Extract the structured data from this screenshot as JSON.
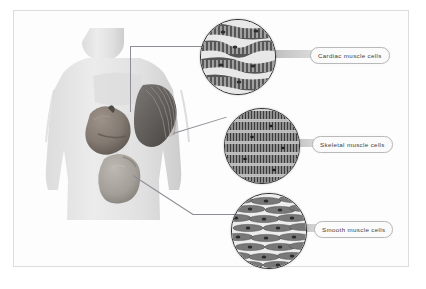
{
  "figure": {
    "background_color": "#ffffff",
    "border_color": "#dcdcdc"
  },
  "body_diagram": {
    "name": "human-torso",
    "description": "Grayscale male torso shown from the front with internal organs visible",
    "skin_color": "#e3e3e3",
    "organs": [
      {
        "name": "heart",
        "tissue": "cardiac",
        "color": "#8a8078"
      },
      {
        "name": "pectoral-muscle",
        "tissue": "skeletal",
        "color": "#6d6a68"
      },
      {
        "name": "stomach",
        "tissue": "smooth",
        "color": "#a9a49d"
      }
    ]
  },
  "callouts": [
    {
      "id": "cardiac",
      "label": "Cardiac muscle cells",
      "source_organ": "heart",
      "tissue_description": "Branching striated fibers joined at intercalated discs",
      "cell_color": "#5a5a5a",
      "background_color": "#e6e6e6"
    },
    {
      "id": "skeletal",
      "label": "Skeletal muscle cells",
      "source_organ": "pectoral-muscle",
      "tissue_description": "Long parallel multinucleated striated fibers",
      "cell_color": "#3f3f3f",
      "background_color": "#cfcfcf"
    },
    {
      "id": "smooth",
      "label": "Smooth muscle cells",
      "source_organ": "stomach",
      "tissue_description": "Spindle-shaped non-striated cells with single central nuclei",
      "cell_color": "#6b6b6b",
      "background_color": "#e2e2e2"
    }
  ]
}
